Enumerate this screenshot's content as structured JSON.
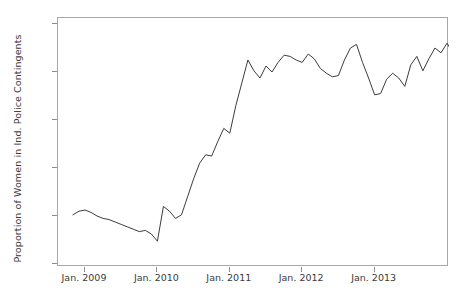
{
  "chart_data": {
    "type": "line",
    "title": "",
    "subtitle": "",
    "xlabel": "",
    "ylabel": "Proportion of Women in Ind. Police Contingents",
    "xlim": [
      "2008-10",
      "2013-12"
    ],
    "ylim": [
      0.06,
      0.163
    ],
    "grid": false,
    "legend": null,
    "legend_position": "none",
    "line_color": "#3c3c3c",
    "line_width": 1,
    "y_ticks": [
      0.06,
      0.08,
      0.1,
      0.12,
      0.14,
      0.16
    ],
    "y_tick_labels": [
      ".06",
      ".08",
      ".1",
      ".12",
      ".14",
      ".16"
    ],
    "x_ticks": [
      "2009-01",
      "2010-01",
      "2011-01",
      "2012-01",
      "2013-01"
    ],
    "x_tick_labels": [
      "Jan. 2009",
      "Jan. 2010",
      "Jan. 2011",
      "Jan. 2012",
      "Jan. 2013"
    ],
    "x": [
      "2008-11",
      "2008-12",
      "2009-01",
      "2009-02",
      "2009-03",
      "2009-04",
      "2009-05",
      "2009-06",
      "2009-07",
      "2009-08",
      "2009-09",
      "2009-10",
      "2009-11",
      "2009-12",
      "2010-01",
      "2010-02",
      "2010-03",
      "2010-04",
      "2010-05",
      "2010-06",
      "2010-07",
      "2010-08",
      "2010-09",
      "2010-10",
      "2010-11",
      "2010-12",
      "2011-01",
      "2011-02",
      "2011-03",
      "2011-04",
      "2011-05",
      "2011-06",
      "2011-07",
      "2011-08",
      "2011-09",
      "2011-10",
      "2011-11",
      "2011-12",
      "2012-01",
      "2012-02",
      "2012-03",
      "2012-04",
      "2012-05",
      "2012-06",
      "2012-07",
      "2012-08",
      "2012-09",
      "2012-10",
      "2012-11",
      "2012-12",
      "2013-01",
      "2013-02",
      "2013-03",
      "2013-04",
      "2013-05",
      "2013-06",
      "2013-07",
      "2013-08",
      "2013-09",
      "2013-10",
      "2013-11",
      "2013-12"
    ],
    "values": [
      0.0805,
      0.082,
      0.0825,
      0.0815,
      0.08,
      0.079,
      0.0785,
      0.0775,
      0.0765,
      0.0755,
      0.0745,
      0.0735,
      0.074,
      0.0725,
      0.0695,
      0.084,
      0.082,
      0.079,
      0.0805,
      0.088,
      0.0955,
      0.102,
      0.1055,
      0.105,
      0.111,
      0.1165,
      0.1145,
      0.126,
      0.1355,
      0.145,
      0.1405,
      0.1375,
      0.1425,
      0.14,
      0.144,
      0.147,
      0.1465,
      0.145,
      0.144,
      0.1475,
      0.1455,
      0.1415,
      0.1395,
      0.138,
      0.1385,
      0.145,
      0.15,
      0.1515,
      0.144,
      0.1375,
      0.1305,
      0.131,
      0.137,
      0.1395,
      0.1375,
      0.134,
      0.143,
      0.1465,
      0.1405,
      0.1455,
      0.15,
      0.148
    ],
    "values_tail": [
      0.152,
      0.148,
      0.1445,
      0.147,
      0.1555,
      0.1605,
      0.154,
      0.149,
      0.1435,
      0.151
    ]
  },
  "axes": {
    "y_axis_title": "Proportion of Women in Ind. Police Contingents"
  }
}
